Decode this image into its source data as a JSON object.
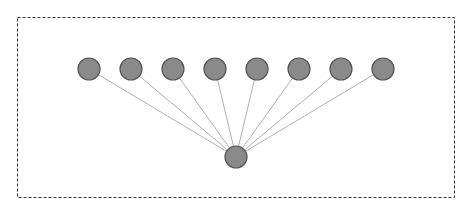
{
  "diagram": {
    "type": "star-graph",
    "frame": {
      "x": 17,
      "y": 17,
      "width": 437,
      "height": 180,
      "stroke": "#333333",
      "dash": "3,2"
    },
    "node_style": {
      "radius": 11,
      "fill": "#8a8a8a",
      "stroke": "#555555"
    },
    "edge_style": {
      "stroke": "#b0b0b0",
      "width": 1
    },
    "hub": {
      "id": "hub",
      "x": 236,
      "y": 157
    },
    "leaves": [
      {
        "id": "n1",
        "x": 89,
        "y": 69
      },
      {
        "id": "n2",
        "x": 131,
        "y": 69
      },
      {
        "id": "n3",
        "x": 173,
        "y": 69
      },
      {
        "id": "n4",
        "x": 215,
        "y": 69
      },
      {
        "id": "n5",
        "x": 257,
        "y": 69
      },
      {
        "id": "n6",
        "x": 299,
        "y": 69
      },
      {
        "id": "n7",
        "x": 341,
        "y": 69
      },
      {
        "id": "n8",
        "x": 383,
        "y": 69
      }
    ]
  }
}
